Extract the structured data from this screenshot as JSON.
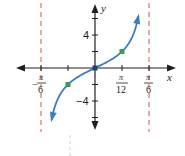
{
  "chart_data": {
    "type": "line",
    "title": "",
    "function": "y = 2 tan 3x",
    "xlabel": "x",
    "ylabel": "y",
    "xlim": [
      -0.5236,
      0.5236
    ],
    "ylim": [
      -7,
      7
    ],
    "x_ticks": [
      {
        "value": -0.5236,
        "label_num": "π",
        "label_den": "6",
        "sign": "−"
      },
      {
        "value": -0.2618,
        "label_num": "",
        "label_den": "",
        "sign": ""
      },
      {
        "value": 0.2618,
        "label_num": "π",
        "label_den": "12",
        "sign": ""
      },
      {
        "value": 0.5236,
        "label_num": "π",
        "label_den": "6",
        "sign": ""
      }
    ],
    "y_ticks": [
      {
        "value": 4,
        "label": "4"
      },
      {
        "value": -4,
        "label": "−4"
      },
      {
        "value": 2,
        "label": ""
      },
      {
        "value": -2,
        "label": ""
      },
      {
        "value": 6,
        "label": ""
      },
      {
        "value": -6,
        "label": ""
      }
    ],
    "asymptotes": [
      {
        "x": -0.5236,
        "label": "x = −π/6"
      },
      {
        "x": 0.5236,
        "label": "x = π/6"
      }
    ],
    "points": [
      {
        "x": -0.2618,
        "y": -2,
        "label": "(−π/12, −2)"
      },
      {
        "x": 0,
        "y": 0,
        "label": "(0, 0)"
      },
      {
        "x": 0.2618,
        "y": 2,
        "label": "(π/12, 2)"
      }
    ],
    "series": [
      {
        "name": "y = 2 tan 3x",
        "color": "#3b7dc4"
      }
    ],
    "colors": {
      "curve": "#3b7dc4",
      "points": "#3a9a5b",
      "asymptote": "#e0706a",
      "axes": "#231f20"
    },
    "grid": false,
    "legend": "none"
  },
  "labels": {
    "x_axis": "x",
    "y_axis": "y",
    "y_tick_4": "4",
    "y_tick_neg4": "−4",
    "x_tick_neg_pi6_sign": "−",
    "x_tick_neg_pi6_num": "π",
    "x_tick_neg_pi6_den": "6",
    "x_tick_pi12_num": "π",
    "x_tick_pi12_den": "12",
    "x_tick_pi6_num": "π",
    "x_tick_pi6_den": "6"
  }
}
